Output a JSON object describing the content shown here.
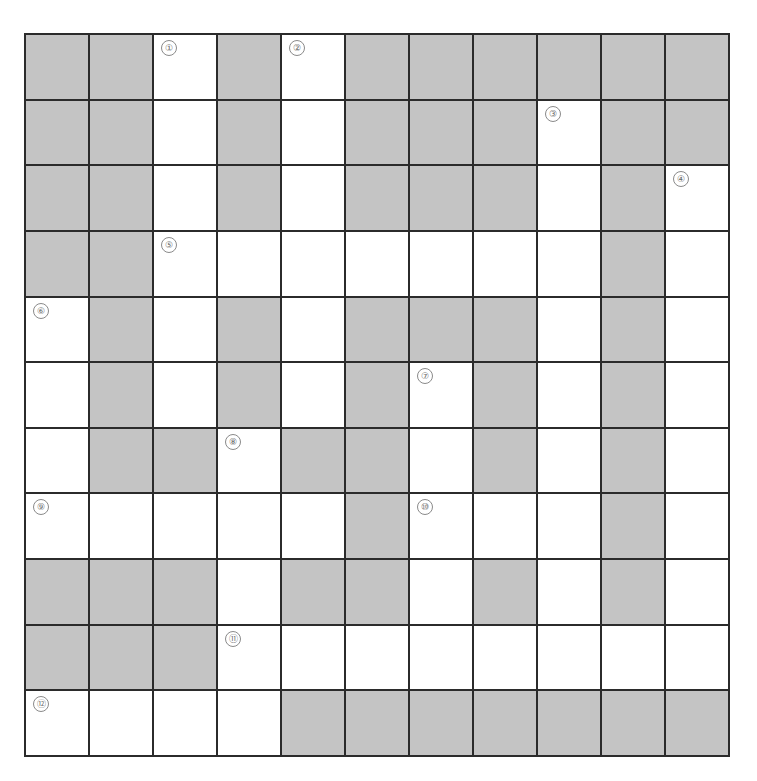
{
  "puzzle": {
    "type": "crossword",
    "rows": 11,
    "cols": 11,
    "colors": {
      "block": "#c4c4c4",
      "white": "#ffffff",
      "line": "#2b2b2b",
      "number": "#6a6a6a"
    },
    "layout": [
      "BBWBWBBBBBB",
      "BBWBWBBBWBB",
      "BBWBWBBBWBW",
      "BBWWWWWWWBW",
      "WBWBWBBBWBW",
      "WBWBWBWBWBW",
      "WBBWBBWBWBW",
      "WWWWWBWWWBW",
      "BBBWBBWBWBW",
      "BBBWWWWWWWW",
      "WWWWBBBBBBB"
    ],
    "numbers": [
      {
        "row": 0,
        "col": 2,
        "label": "①"
      },
      {
        "row": 0,
        "col": 4,
        "label": "②"
      },
      {
        "row": 1,
        "col": 8,
        "label": "③"
      },
      {
        "row": 2,
        "col": 10,
        "label": "④"
      },
      {
        "row": 3,
        "col": 2,
        "label": "⑤"
      },
      {
        "row": 4,
        "col": 0,
        "label": "⑥"
      },
      {
        "row": 5,
        "col": 6,
        "label": "⑦"
      },
      {
        "row": 6,
        "col": 3,
        "label": "⑧"
      },
      {
        "row": 7,
        "col": 0,
        "label": "⑨"
      },
      {
        "row": 7,
        "col": 6,
        "label": "⑩"
      },
      {
        "row": 9,
        "col": 3,
        "label": "⑪"
      },
      {
        "row": 10,
        "col": 0,
        "label": "⑫"
      }
    ]
  }
}
